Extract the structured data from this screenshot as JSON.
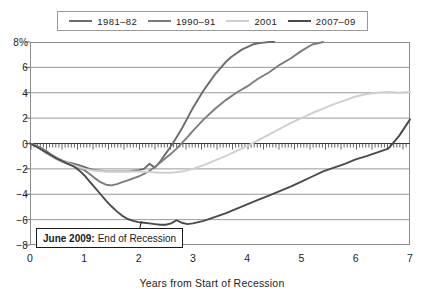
{
  "chart_data": {
    "type": "line",
    "title": "",
    "xlabel": "Years from Start of Recession",
    "ylabel": "",
    "xlim": [
      0,
      7
    ],
    "ylim": [
      -8,
      8
    ],
    "grid": true,
    "legend_position": "top",
    "xticks": [
      "0",
      "1",
      "2",
      "3",
      "4",
      "5",
      "6",
      "7"
    ],
    "yticks": [
      "8%",
      "6",
      "4",
      "2",
      "0",
      "−2",
      "−4",
      "−6",
      "−8"
    ],
    "ytick_values": [
      8,
      6,
      4,
      2,
      0,
      -2,
      -4,
      -6,
      -8
    ],
    "zero_line_style": "hatched-ticks-downward",
    "annotations": [
      {
        "name": "june-2009-callout",
        "bold_text": "June 2009:",
        "text": " End of Recession",
        "points_to": {
          "x": 2.05,
          "y": -6.15
        }
      }
    ],
    "series": [
      {
        "name": "1981–82",
        "color": "#6b6b6b",
        "x": [
          0,
          0.1,
          0.2,
          0.3,
          0.4,
          0.5,
          0.6,
          0.7,
          0.8,
          0.9,
          1.0,
          1.1,
          1.2,
          1.3,
          1.4,
          1.5,
          1.6,
          1.7,
          1.8,
          1.9,
          2.0,
          2.1,
          2.2,
          2.3,
          2.4,
          2.5,
          2.6,
          2.7,
          2.8,
          2.9,
          3.0,
          3.1,
          3.2,
          3.3,
          3.4,
          3.5,
          3.6,
          3.7,
          3.8,
          3.9,
          4.0,
          4.1,
          4.2,
          4.3,
          4.4,
          4.5
        ],
        "y": [
          0,
          -0.15,
          -0.35,
          -0.6,
          -0.9,
          -1.15,
          -1.35,
          -1.5,
          -1.6,
          -1.7,
          -1.85,
          -2.0,
          -2.1,
          -2.15,
          -2.2,
          -2.2,
          -2.2,
          -2.2,
          -2.2,
          -2.15,
          -2.1,
          -2.0,
          -1.6,
          -1.9,
          -1.4,
          -0.8,
          -0.2,
          0.5,
          1.2,
          2.0,
          2.8,
          3.5,
          4.2,
          4.8,
          5.4,
          5.9,
          6.4,
          6.8,
          7.1,
          7.4,
          7.6,
          7.8,
          7.9,
          7.95,
          8.0,
          8.0
        ]
      },
      {
        "name": "1990–91",
        "color": "#7c7c7c",
        "x": [
          0,
          0.1,
          0.2,
          0.3,
          0.4,
          0.5,
          0.6,
          0.7,
          0.8,
          0.9,
          1.0,
          1.1,
          1.2,
          1.3,
          1.4,
          1.5,
          1.6,
          1.7,
          1.8,
          1.9,
          2.0,
          2.1,
          2.2,
          2.3,
          2.4,
          2.5,
          2.6,
          2.7,
          2.8,
          2.9,
          3.0,
          3.2,
          3.4,
          3.6,
          3.8,
          4.0,
          4.2,
          4.4,
          4.6,
          4.8,
          5.0,
          5.2,
          5.4
        ],
        "y": [
          0,
          -0.2,
          -0.45,
          -0.75,
          -1.0,
          -1.25,
          -1.45,
          -1.6,
          -1.75,
          -1.9,
          -2.1,
          -2.4,
          -2.75,
          -3.05,
          -3.25,
          -3.3,
          -3.2,
          -3.05,
          -2.9,
          -2.75,
          -2.6,
          -2.4,
          -2.15,
          -1.85,
          -1.5,
          -1.15,
          -0.8,
          -0.4,
          0.05,
          0.5,
          1.0,
          1.9,
          2.7,
          3.4,
          4.0,
          4.5,
          5.1,
          5.6,
          6.2,
          6.7,
          7.3,
          7.8,
          8.0
        ]
      },
      {
        "name": "2001",
        "color": "#cfcfcf",
        "x": [
          0,
          0.1,
          0.2,
          0.3,
          0.4,
          0.5,
          0.6,
          0.7,
          0.8,
          0.9,
          1.0,
          1.2,
          1.4,
          1.6,
          1.8,
          2.0,
          2.2,
          2.4,
          2.6,
          2.8,
          3.0,
          3.2,
          3.4,
          3.6,
          3.8,
          4.0,
          4.2,
          4.4,
          4.6,
          4.8,
          5.0,
          5.2,
          5.4,
          5.6,
          5.8,
          6.0,
          6.2,
          6.4,
          6.6,
          6.8,
          7.0
        ],
        "y": [
          0,
          -0.2,
          -0.45,
          -0.7,
          -0.95,
          -1.2,
          -1.4,
          -1.55,
          -1.7,
          -1.85,
          -2.0,
          -2.15,
          -2.2,
          -2.2,
          -2.2,
          -2.2,
          -2.25,
          -2.3,
          -2.3,
          -2.2,
          -2.0,
          -1.7,
          -1.35,
          -1.0,
          -0.6,
          -0.2,
          0.25,
          0.7,
          1.15,
          1.6,
          2.0,
          2.4,
          2.75,
          3.1,
          3.4,
          3.7,
          3.9,
          4.0,
          4.05,
          4.0,
          4.05
        ]
      },
      {
        "name": "2007–09",
        "color": "#4a4a4a",
        "x": [
          0,
          0.1,
          0.2,
          0.3,
          0.4,
          0.5,
          0.6,
          0.7,
          0.8,
          0.9,
          1.0,
          1.1,
          1.2,
          1.3,
          1.4,
          1.5,
          1.6,
          1.7,
          1.8,
          1.9,
          2.0,
          2.1,
          2.2,
          2.3,
          2.4,
          2.5,
          2.6,
          2.7,
          2.8,
          2.9,
          3.0,
          3.2,
          3.4,
          3.6,
          3.8,
          4.0,
          4.2,
          4.4,
          4.6,
          4.8,
          5.0,
          5.2,
          5.4,
          5.6,
          5.8,
          6.0,
          6.2,
          6.4,
          6.6,
          6.8,
          7.0
        ],
        "y": [
          0,
          -0.2,
          -0.45,
          -0.7,
          -0.95,
          -1.2,
          -1.4,
          -1.6,
          -1.8,
          -2.1,
          -2.5,
          -3.0,
          -3.5,
          -4.0,
          -4.5,
          -4.95,
          -5.35,
          -5.7,
          -5.95,
          -6.1,
          -6.2,
          -6.25,
          -6.3,
          -6.35,
          -6.4,
          -6.4,
          -6.3,
          -6.05,
          -6.25,
          -6.35,
          -6.3,
          -6.1,
          -5.8,
          -5.5,
          -5.15,
          -4.8,
          -4.45,
          -4.1,
          -3.75,
          -3.4,
          -3.0,
          -2.6,
          -2.2,
          -1.9,
          -1.6,
          -1.25,
          -1.0,
          -0.7,
          -0.4,
          0.6,
          1.9
        ]
      }
    ]
  },
  "legend": {
    "items": [
      {
        "label": "1981–82",
        "color": "#6b6b6b"
      },
      {
        "label": "1990–91",
        "color": "#7c7c7c"
      },
      {
        "label": "2001",
        "color": "#cfcfcf"
      },
      {
        "label": "2007–09",
        "color": "#4a4a4a"
      }
    ]
  },
  "axes": {
    "x_title": "Years from Start of Recession",
    "x_ticks": [
      "0",
      "1",
      "2",
      "3",
      "4",
      "5",
      "6",
      "7"
    ],
    "y_ticks": [
      "8%",
      "6",
      "4",
      "2",
      "0",
      "−2",
      "−4",
      "−6",
      "−8"
    ]
  },
  "callout": {
    "bold": "June 2009:",
    "text": " End of Recession"
  },
  "colors": {
    "frame": "#8d8d8d",
    "grid": "#8d8d8d",
    "text": "#1d1d1d",
    "background": "#ffffff"
  }
}
